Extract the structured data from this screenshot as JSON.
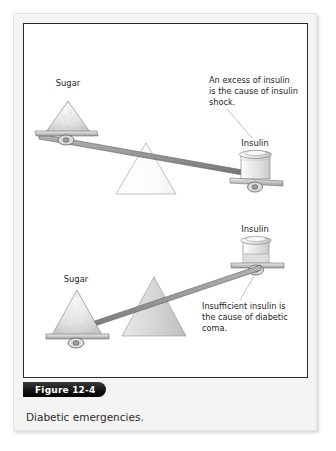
{
  "figure": {
    "badge_label": "Figure 12-4",
    "caption": "Diabetic emergencies."
  },
  "scales": [
    {
      "id": "insulin-shock",
      "tilt": "insulin-side-down",
      "sugar_label": "Sugar",
      "insulin_label": "Insulin",
      "annotation_lines": [
        "An excess of insulin",
        "is the cause of insulin",
        "shock."
      ],
      "insulin_fill_level": "full",
      "sugar_amount": "small"
    },
    {
      "id": "diabetic-coma",
      "tilt": "sugar-side-down",
      "sugar_label": "Sugar",
      "insulin_label": "Insulin",
      "annotation_lines": [
        "Insufficient insulin is",
        "the cause of diabetic",
        "coma."
      ],
      "insulin_fill_level": "partial",
      "sugar_amount": "large"
    }
  ],
  "colors": {
    "badge_background": "#151515",
    "badge_text": "#ffffff",
    "panel_background": "#f4f4f4",
    "figure_background": "#ffffff",
    "frame_border": "#2b2b2b",
    "beam": "#8d8d8d",
    "beam_outline": "#4a4a4a",
    "fulcrum_light": "#fcfcfc",
    "fulcrum_gray": "#d6d6d6",
    "sugar_fill": "#e2e2e2",
    "text": "#1d1d1d",
    "leader_line": "#a9a9a9"
  }
}
